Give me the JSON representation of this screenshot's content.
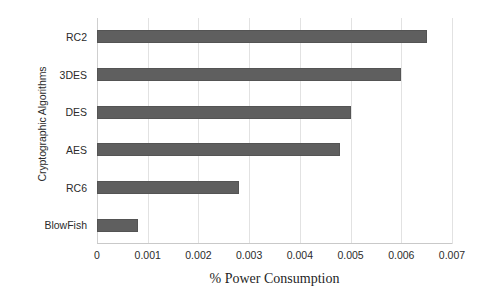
{
  "chart_data": {
    "type": "bar",
    "orientation": "horizontal",
    "title": "",
    "xlabel": "% Power Consumption",
    "ylabel": "Cryptographic Algorithms",
    "categories": [
      "RC2",
      "3DES",
      "DES",
      "AES",
      "RC6",
      "BlowFish"
    ],
    "values": [
      0.0065,
      0.006,
      0.005,
      0.0048,
      0.0028,
      0.0008
    ],
    "series": [
      {
        "name": "% Power Consumption",
        "values": [
          0.0065,
          0.006,
          0.005,
          0.0048,
          0.0028,
          0.0008
        ]
      }
    ],
    "xlim": [
      0,
      0.007
    ],
    "xticks": [
      0,
      0.001,
      0.002,
      0.003,
      0.004,
      0.005,
      0.006,
      0.007
    ],
    "xtick_labels": [
      "0",
      "0.001",
      "0.002",
      "0.003",
      "0.004",
      "0.005",
      "0.006",
      "0.007"
    ],
    "ytick_labels": [
      "RC2",
      "3DES",
      "DES",
      "AES",
      "RC6",
      "BlowFish"
    ],
    "grid": "vertical",
    "legend": "none",
    "bar_color": "#5f5f5f",
    "gridline_color": "#e2e2e2",
    "background_color": "#ffffff"
  },
  "axes": {
    "x_title": "% Power Consumption",
    "y_title": "Cryptographic Algorithms"
  }
}
